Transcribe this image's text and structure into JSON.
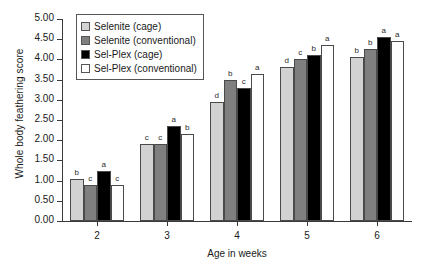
{
  "chart_data": {
    "type": "bar",
    "title": "",
    "xlabel": "Age in weeks",
    "ylabel": "Whole body feathering score",
    "categories": [
      "2",
      "3",
      "4",
      "5",
      "6"
    ],
    "ylim": [
      0.0,
      5.0
    ],
    "ytick_step": 0.5,
    "ytick_labels": [
      "0.00",
      "0.50",
      "1.00",
      "1.50",
      "2.00",
      "2.50",
      "3.00",
      "3.50",
      "4.00",
      "4.50",
      "5.00"
    ],
    "grid": false,
    "legend_position": "top-left",
    "series": [
      {
        "name": "Selenite (cage)",
        "color": "#d2d2d2",
        "values": [
          1.05,
          1.9,
          2.95,
          3.8,
          4.05
        ],
        "letters": [
          "b",
          "c",
          "d",
          "d",
          "b"
        ]
      },
      {
        "name": "Selenite (conventional)",
        "color": "#7f7f7f",
        "values": [
          0.9,
          1.9,
          3.5,
          4.0,
          4.25
        ],
        "letters": [
          "c",
          "c",
          "b",
          "c",
          "b"
        ]
      },
      {
        "name": "Sel-Plex (cage)",
        "color": "#000000",
        "values": [
          1.25,
          2.35,
          3.3,
          4.1,
          4.55
        ],
        "letters": [
          "a",
          "a",
          "c",
          "b",
          "a"
        ]
      },
      {
        "name": "Sel-Plex (conventional)",
        "color": "#ffffff",
        "values": [
          0.9,
          2.15,
          3.65,
          4.35,
          4.45
        ],
        "letters": [
          "c",
          "b",
          "a",
          "a",
          "a"
        ]
      }
    ]
  },
  "legend": {
    "items": [
      {
        "label": "Selenite (cage)"
      },
      {
        "label": "Selenite (conventional)"
      },
      {
        "label": "Sel-Plex (cage)"
      },
      {
        "label": "Sel-Plex (conventional)"
      }
    ]
  }
}
